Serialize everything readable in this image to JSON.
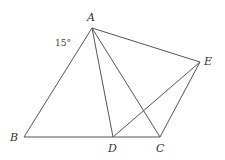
{
  "diagram": {
    "points": {
      "A": {
        "label": "A",
        "x": 92,
        "y": 28
      },
      "B": {
        "label": "B",
        "x": 24,
        "y": 137
      },
      "C": {
        "label": "C",
        "x": 160,
        "y": 137
      },
      "D": {
        "label": "D",
        "x": 113,
        "y": 137
      },
      "E": {
        "label": "E",
        "x": 200,
        "y": 62
      }
    },
    "segments": [
      "AB",
      "BC",
      "AC",
      "AD",
      "AE",
      "EC",
      "ED"
    ],
    "angle_annotation": {
      "text": "15°",
      "at": "A"
    }
  }
}
